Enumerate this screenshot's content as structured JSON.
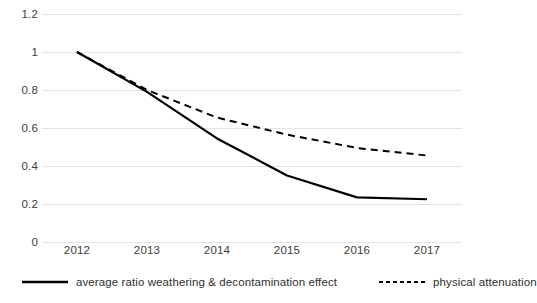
{
  "chart_data": {
    "type": "line",
    "title": "",
    "subtitle": "",
    "xlabel": "",
    "ylabel": "",
    "categories": [
      "2012",
      "2013",
      "2014",
      "2015",
      "2016",
      "2017"
    ],
    "ylim": [
      0,
      1.2
    ],
    "yticks": [
      "0",
      "0.2",
      "0.4",
      "0.6",
      "0.8",
      "1",
      "1.2"
    ],
    "ytick_values": [
      0,
      0.2,
      0.4,
      0.6,
      0.8,
      1,
      1.2
    ],
    "grid": "horizontal",
    "legend_position": "bottom",
    "series": [
      {
        "name": "average ratio weathering & decontamination effect",
        "style": "solid",
        "color": "#000000",
        "values": [
          1.0,
          0.79,
          0.545,
          0.35,
          0.235,
          0.225
        ]
      },
      {
        "name": "physical attenuation",
        "style": "dashed",
        "color": "#000000",
        "values": [
          1.0,
          0.8,
          0.655,
          0.565,
          0.495,
          0.455
        ]
      }
    ]
  },
  "legend": {
    "entries": [
      {
        "label": "average ratio weathering & decontamination effect",
        "style": "solid"
      },
      {
        "label": "physical attenuation",
        "style": "dashed"
      }
    ]
  },
  "colors": {
    "gridline": "#e3e3e3",
    "tick_text": "#3d3d3d",
    "line": "#000000",
    "background": "#ffffff"
  }
}
